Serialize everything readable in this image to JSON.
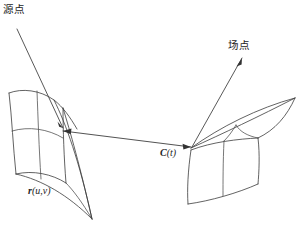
{
  "figure": {
    "title_alt": "Source point and field point on two surface patches",
    "background_color": "#ffffff",
    "stroke_color": "#3b3b3b",
    "width": 301,
    "height": 228
  },
  "labels": {
    "source_point": "源点",
    "field_point": "场点",
    "surface_vector_sym": "r",
    "surface_vector_args": "(u,v)",
    "curve_vector_sym": "C",
    "curve_vector_args": "(t)"
  },
  "annotations": {
    "source_leader": {
      "name": "source-point-leader",
      "from": [
        18,
        30
      ],
      "to": [
        63,
        129
      ]
    },
    "field_leader": {
      "name": "field-point-leader",
      "from": [
        192,
        147
      ],
      "to": [
        242,
        58
      ]
    },
    "connecting_vector": {
      "name": "distance-vector",
      "from": [
        63,
        131
      ],
      "to": [
        191,
        147
      ],
      "double_headed": true
    }
  },
  "patches": {
    "left": {
      "name": "left-surface-patch",
      "label_ref": "r(u,v)",
      "bounds": [
        8,
        88,
        96,
        222
      ]
    },
    "right": {
      "name": "right-surface-patch",
      "label_ref": "C(t)",
      "bounds": [
        178,
        94,
        297,
        206
      ]
    }
  }
}
